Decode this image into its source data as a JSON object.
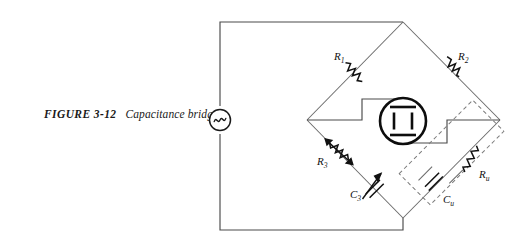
{
  "figure": {
    "number": "FIGURE 3-12",
    "caption": "Capacitance bridge."
  },
  "source": {
    "name": "ac-source",
    "symbol": "~"
  },
  "detector": {
    "name": "magic-eye-null-detector",
    "label": ""
  },
  "components": {
    "r1": {
      "label": "R",
      "sub": "1",
      "type": "resistor",
      "variable": false
    },
    "r2": {
      "label": "R",
      "sub": "2",
      "type": "resistor",
      "variable": false
    },
    "r3": {
      "label": "R",
      "sub": "3",
      "type": "resistor",
      "variable": true
    },
    "c3": {
      "label": "C",
      "sub": "3",
      "type": "capacitor",
      "variable": true
    },
    "ru": {
      "label": "R",
      "sub": "u",
      "type": "resistor",
      "variable": false
    },
    "cu": {
      "label": "C",
      "sub": "u",
      "type": "capacitor",
      "variable": false
    }
  },
  "unknown_enclosure": {
    "name": "unknown-impedance-dashed-box",
    "style": "dashed"
  },
  "colors": {
    "background": "#ffffff",
    "wire": "#4a4a4a",
    "arm": "#6a6a6a",
    "component": "#111111",
    "dashed": "#7c7c7c",
    "text": "#1a1a1a"
  }
}
